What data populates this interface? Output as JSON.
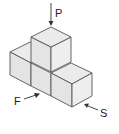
{
  "diagram": {
    "background": "#ffffff",
    "edge_color": "#555555",
    "views": [
      {
        "id": "top",
        "label": "P",
        "direction": "from above"
      },
      {
        "id": "front",
        "label": "F",
        "direction": "front-left"
      },
      {
        "id": "side",
        "label": "S",
        "direction": "front-right"
      }
    ],
    "cubes": [
      {
        "name": "front-left-cube",
        "layer": 1
      },
      {
        "name": "front-middle-cube",
        "layer": 1
      },
      {
        "name": "front-right-cube",
        "layer": 1
      },
      {
        "name": "top-cube",
        "layer": 2
      }
    ]
  }
}
